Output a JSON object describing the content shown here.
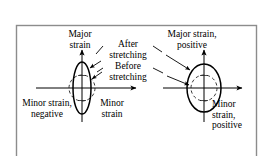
{
  "figure": {
    "frame": {
      "border_color": "#888888",
      "background": "#ffffff",
      "x": 16,
      "y": 25,
      "width": 241,
      "height": 140
    },
    "stroke_color": "#000000",
    "dashed_color": "#333333",
    "labels": {
      "major_strain_left": "Major\nstrain",
      "after_stretching": "After\nstretching",
      "before_stretching": "Before\nstretching",
      "major_strain_right": "Major strain,\npositive",
      "minor_strain_negative": "Minor strain,\nnegative",
      "minor_strain_middle": "Minor\nstrain",
      "minor_strain_positive": "Minor\nstrain,\npositive"
    },
    "diagrams": [
      {
        "name": "left-diagram",
        "origin_x": 82,
        "origin_y": 88,
        "before_circle_rx": 13,
        "before_circle_ry": 13,
        "after_ellipse_rx": 9,
        "after_ellipse_ry": 26,
        "x_axis_start": 36,
        "x_axis_end": 140,
        "y_axis_top": 47,
        "y_axis_bottom": 122,
        "description": "Minor strain negative: circle becomes a tall narrow ellipse"
      },
      {
        "name": "right-diagram",
        "origin_x": 204,
        "origin_y": 88,
        "before_circle_rx": 13,
        "before_circle_ry": 13,
        "after_ellipse_rx": 17,
        "after_ellipse_ry": 24,
        "x_axis_start": 163,
        "x_axis_end": 246,
        "y_axis_top": 47,
        "y_axis_bottom": 122,
        "description": "Minor strain positive: circle becomes a larger ellipse"
      }
    ],
    "leaders": [
      {
        "name": "after-stretching-to-left-ellipse",
        "from_x": 102,
        "from_y": 48,
        "to_x": 90,
        "to_y": 68
      },
      {
        "name": "before-stretching-to-left-circle",
        "from_x": 102,
        "from_y": 70,
        "to_x": 92,
        "to_y": 78
      },
      {
        "name": "after-stretching-to-right-ellipse",
        "from_x": 154,
        "from_y": 48,
        "to_x": 189,
        "to_y": 70
      },
      {
        "name": "before-stretching-to-right-circle",
        "from_x": 154,
        "from_y": 70,
        "to_x": 187,
        "to_y": 83
      }
    ]
  }
}
